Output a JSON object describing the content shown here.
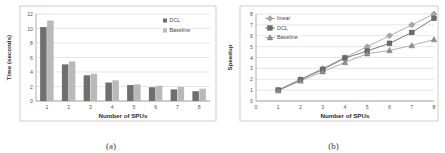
{
  "figure": {
    "panel_a": {
      "caption": "(a)",
      "legend_position": "top-right",
      "legend": [
        {
          "label": "DCL",
          "marker": "square",
          "color": "#6f6f6f"
        },
        {
          "label": "Baseline",
          "marker": "square",
          "color": "#b9b9b9"
        }
      ]
    },
    "panel_b": {
      "caption": "(b)",
      "legend_position": "top-left",
      "legend": [
        {
          "label": "linear",
          "marker": "diamond",
          "color": "#a8a8a8"
        },
        {
          "label": "DCL",
          "marker": "square",
          "color": "#6b6b6b"
        },
        {
          "label": "Baseline",
          "marker": "triangle",
          "color": "#8f8f8f"
        }
      ]
    }
  },
  "chart_data": [
    {
      "type": "bar",
      "title": "",
      "xlabel": "Number of SPUs",
      "ylabel": "Time (seconds)",
      "categories": [
        "1",
        "2",
        "3",
        "4",
        "5",
        "6",
        "7",
        "8"
      ],
      "ylim": [
        0,
        12
      ],
      "yticks": [
        0,
        2,
        4,
        6,
        8,
        10,
        12
      ],
      "grid": true,
      "legend": [
        "DCL",
        "Baseline"
      ],
      "series": [
        {
          "name": "DCL",
          "color": "#6f6f6f",
          "values": [
            10.2,
            5.05,
            3.55,
            2.55,
            2.2,
            1.9,
            1.6,
            1.35
          ]
        },
        {
          "name": "Baseline",
          "color": "#b9b9b9",
          "values": [
            11.1,
            5.45,
            3.75,
            2.85,
            2.3,
            2.1,
            1.95,
            1.7
          ]
        }
      ]
    },
    {
      "type": "line",
      "title": "",
      "xlabel": "Number of SPUs",
      "ylabel": "Speedup",
      "x": [
        1,
        2,
        3,
        4,
        5,
        6,
        7,
        8
      ],
      "xlim": [
        0,
        8
      ],
      "xticks": [
        0,
        1,
        2,
        3,
        4,
        5,
        6,
        7,
        8
      ],
      "ylim": [
        0,
        8
      ],
      "yticks": [
        0,
        1,
        2,
        3,
        4,
        5,
        6,
        7,
        8
      ],
      "grid": true,
      "legend": [
        "linear",
        "DCL",
        "Baseline"
      ],
      "series": [
        {
          "name": "linear",
          "marker": "diamond",
          "color": "#a8a8a8",
          "values": [
            1.0,
            2.0,
            3.0,
            4.0,
            5.0,
            6.0,
            7.0,
            8.0
          ]
        },
        {
          "name": "DCL",
          "marker": "square",
          "color": "#6b6b6b",
          "values": [
            1.0,
            1.95,
            2.9,
            3.95,
            4.6,
            5.3,
            6.3,
            7.6
          ]
        },
        {
          "name": "Baseline",
          "marker": "triangle",
          "color": "#8f8f8f",
          "values": [
            0.95,
            1.85,
            2.7,
            3.55,
            4.35,
            4.65,
            5.1,
            5.65
          ]
        }
      ]
    }
  ]
}
